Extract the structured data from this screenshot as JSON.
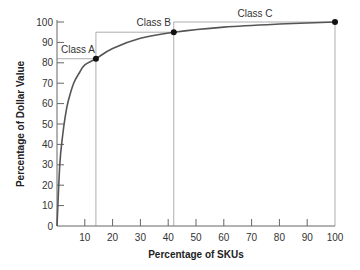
{
  "chart_data": {
    "type": "line",
    "title": "",
    "xlabel": "Percentage of SKUs",
    "ylabel": "Percentage of Dollar Value",
    "xlim": [
      0,
      100
    ],
    "ylim": [
      0,
      100
    ],
    "grid": false,
    "x_ticks": [
      10,
      20,
      30,
      40,
      50,
      60,
      70,
      80,
      90,
      100
    ],
    "y_ticks": [
      0,
      10,
      20,
      30,
      40,
      50,
      60,
      70,
      80,
      90,
      100
    ],
    "series": [
      {
        "name": "Cumulative dollar value (ABC curve)",
        "x": [
          0,
          1,
          2,
          3,
          4,
          6,
          8,
          10,
          14,
          20,
          30,
          42,
          60,
          80,
          100
        ],
        "y": [
          0,
          30,
          44,
          54,
          61,
          70,
          75,
          79,
          82,
          87,
          92,
          95,
          97.5,
          99,
          100
        ]
      }
    ],
    "marked_points": [
      {
        "label": "Class A",
        "x": 14,
        "y": 82
      },
      {
        "label": "Class B",
        "x": 42,
        "y": 95
      },
      {
        "label": "Class C",
        "x": 100,
        "y": 100
      }
    ],
    "annotations": [
      "Class A",
      "Class B",
      "Class C"
    ]
  }
}
